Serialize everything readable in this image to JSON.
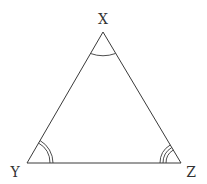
{
  "diagram": {
    "type": "triangle",
    "colors": {
      "stroke": "#3a3a3a",
      "label": "#333333",
      "background": "#ffffff"
    },
    "vertices": [
      {
        "id": "X",
        "label": "X",
        "x": 103,
        "y": 32,
        "label_x": 103,
        "label_y": 24,
        "angle_marks": 1
      },
      {
        "id": "Y",
        "label": "Y",
        "x": 27,
        "y": 163,
        "label_x": 15,
        "label_y": 177,
        "angle_marks": 2
      },
      {
        "id": "Z",
        "label": "Z",
        "x": 181,
        "y": 163,
        "label_x": 191,
        "label_y": 177,
        "angle_marks": 3
      }
    ],
    "edges": [
      {
        "from": "X",
        "to": "Y"
      },
      {
        "from": "Y",
        "to": "Z"
      },
      {
        "from": "Z",
        "to": "X"
      }
    ]
  }
}
